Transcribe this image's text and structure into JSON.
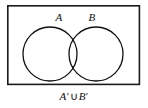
{
  "figure": {
    "type": "venn-diagram",
    "caption": "A' ∪ B'",
    "caption_parts": {
      "set_a": "A",
      "set_a_prime": "′",
      "operator": "∪",
      "set_b": "B",
      "set_b_prime": "′"
    },
    "universe_rect": {
      "name": "universal-set-rectangle",
      "x": 7,
      "y": 5,
      "width": 133,
      "height": 80,
      "stroke": "#1a1a1a",
      "stroke_width": 1.6,
      "fill": "none"
    },
    "circles": [
      {
        "label": "A",
        "name": "circle-set-a",
        "cx": 50,
        "cy": 54,
        "r": 27,
        "stroke": "#111111",
        "stroke_width": 1.3,
        "fill": "none"
      },
      {
        "label": "B",
        "name": "circle-set-b",
        "cx": 96,
        "cy": 54,
        "r": 27,
        "stroke": "#111111",
        "stroke_width": 1.3,
        "fill": "none"
      }
    ],
    "labels": [
      {
        "text": "A",
        "name": "set-a-label",
        "x": 59,
        "y": 18
      },
      {
        "text": "B",
        "name": "set-b-label",
        "x": 92,
        "y": 18
      }
    ],
    "colors": {
      "background": "#ffffff",
      "stroke": "#111111",
      "text": "#0d0d0d"
    }
  }
}
